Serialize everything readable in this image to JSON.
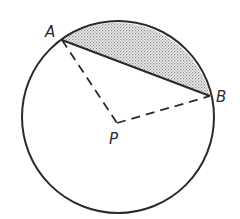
{
  "diagram": {
    "type": "circle-segment",
    "labels": {
      "point_a": "A",
      "point_b": "B",
      "center_p": "P"
    },
    "colors": {
      "stroke": "#2a2a2a",
      "shade": "#bdbdbd",
      "background": "#ffffff"
    }
  }
}
